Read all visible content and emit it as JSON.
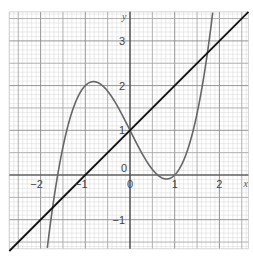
{
  "chart_data": {
    "type": "line",
    "title": "",
    "xlabel": "x",
    "ylabel": "y",
    "xlim": [
      -2.7,
      2.65
    ],
    "ylim": [
      -1.65,
      3.65
    ],
    "grid": true,
    "x_ticks": [
      {
        "value": -2,
        "label": "−2"
      },
      {
        "value": -1,
        "label": "−1"
      },
      {
        "value": 0,
        "label": "0"
      },
      {
        "value": 1,
        "label": "1"
      },
      {
        "value": 2,
        "label": "2"
      }
    ],
    "y_ticks": [
      {
        "value": -1,
        "label": "−1"
      },
      {
        "value": 0,
        "label": "0"
      },
      {
        "value": 1,
        "label": "1"
      },
      {
        "value": 2,
        "label": "2"
      },
      {
        "value": 3,
        "label": "3"
      }
    ],
    "series": [
      {
        "name": "cubic curve",
        "equation": "y = x^3 - 2x + 1",
        "color": "#666666",
        "x": [
          -1.9,
          -1.8,
          -1.6,
          -1.4,
          -1.2,
          -1.0,
          -0.816,
          -0.6,
          -0.4,
          -0.2,
          0,
          0.2,
          0.4,
          0.6,
          0.816,
          1.0,
          1.2,
          1.4,
          1.6,
          1.8,
          1.9
        ],
        "values": [
          -2.06,
          -1.23,
          0.1,
          1.06,
          1.67,
          2.0,
          2.09,
          1.98,
          1.74,
          1.39,
          1.0,
          0.61,
          0.26,
          0.02,
          -0.09,
          0.0,
          0.33,
          0.94,
          1.9,
          3.23,
          4.06
        ]
      },
      {
        "name": "straight line",
        "equation": "y = x + 1",
        "color": "#111111",
        "x": [
          -2.7,
          2.65
        ],
        "values": [
          -1.7,
          3.65
        ]
      }
    ],
    "annotations": {
      "local_max": {
        "x": -0.82,
        "y": 2.09
      },
      "local_min": {
        "x": 0.82,
        "y": -0.09
      },
      "intersections": [
        {
          "x": -1.73,
          "y": -0.73
        },
        {
          "x": 0,
          "y": 1
        },
        {
          "x": 1.73,
          "y": 2.73
        }
      ]
    }
  },
  "labels": {
    "x_axis": "x",
    "y_axis": "y",
    "x_ticks": [
      "−2",
      "−1",
      "0",
      "1",
      "2"
    ],
    "y_ticks": [
      "−1",
      "0",
      "1",
      "2",
      "3"
    ]
  }
}
